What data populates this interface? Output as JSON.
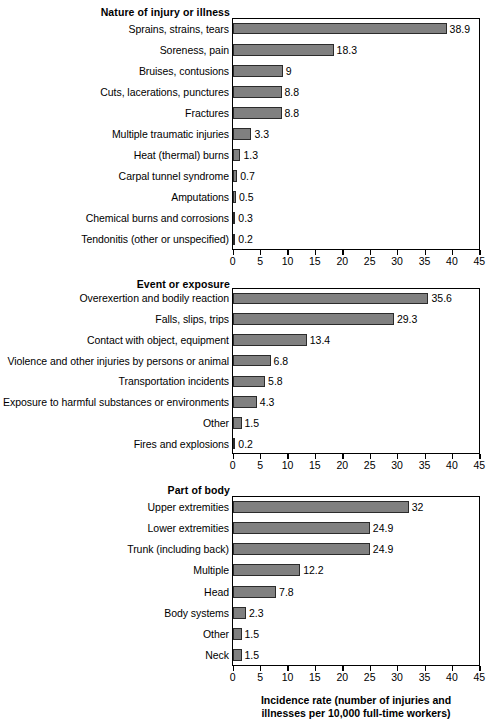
{
  "chart_data": [
    {
      "type": "bar",
      "orientation": "horizontal",
      "title": "Nature of injury or illness",
      "xlabel": "",
      "ylabel": "",
      "xlim": [
        0,
        45
      ],
      "ticks": [
        0,
        5,
        10,
        15,
        20,
        25,
        30,
        35,
        40,
        45
      ],
      "grid": false,
      "legend": "none",
      "categories": [
        "Sprains, strains, tears",
        "Soreness, pain",
        "Bruises, contusions",
        "Cuts, lacerations, punctures",
        "Fractures",
        "Multiple traumatic injuries",
        "Heat (thermal) burns",
        "Carpal tunnel syndrome",
        "Amputations",
        "Chemical burns and corrosions",
        "Tendonitis (other or unspecified)"
      ],
      "values": [
        38.9,
        18.3,
        9,
        8.8,
        8.8,
        3.3,
        1.3,
        0.7,
        0.5,
        0.3,
        0.2
      ],
      "labels": [
        "38.9",
        "18.3",
        "9",
        "8.8",
        "8.8",
        "3.3",
        "1.3",
        "0.7",
        "0.5",
        "0.3",
        "0.2"
      ]
    },
    {
      "type": "bar",
      "orientation": "horizontal",
      "title": "Event or exposure",
      "xlabel": "",
      "ylabel": "",
      "xlim": [
        0,
        45
      ],
      "ticks": [
        0,
        5,
        10,
        15,
        20,
        25,
        30,
        35,
        40,
        45
      ],
      "grid": false,
      "legend": "none",
      "categories": [
        "Overexertion and bodily reaction",
        "Falls, slips, trips",
        "Contact with object, equipment",
        "Violence and other injuries by persons or animal",
        "Transportation incidents",
        "Exposure to harmful substances or environments",
        "Other",
        "Fires and explosions"
      ],
      "values": [
        35.6,
        29.3,
        13.4,
        6.8,
        5.8,
        4.3,
        1.5,
        0.2
      ],
      "labels": [
        "35.6",
        "29.3",
        "13.4",
        "6.8",
        "5.8",
        "4.3",
        "1.5",
        "0.2"
      ]
    },
    {
      "type": "bar",
      "orientation": "horizontal",
      "title": "Part of body",
      "xlabel": "Incidence rate (number of injuries and illnesses per 10,000 full-time workers)",
      "ylabel": "",
      "xlim": [
        0,
        45
      ],
      "ticks": [
        0,
        5,
        10,
        15,
        20,
        25,
        30,
        35,
        40,
        45
      ],
      "grid": false,
      "legend": "none",
      "categories": [
        "Upper extremities",
        "Lower extremities",
        "Trunk (including back)",
        "Multiple",
        "Head",
        "Body systems",
        "Other",
        "Neck"
      ],
      "values": [
        32,
        24.9,
        24.9,
        12.2,
        7.8,
        2.3,
        1.5,
        1.5
      ],
      "labels": [
        "32",
        "24.9",
        "24.9",
        "12.2",
        "7.8",
        "2.3",
        "1.5",
        "1.5"
      ]
    }
  ],
  "axis_caption": {
    "line1": "Incidence rate (number of injuries and",
    "line2": "illnesses per 10,000 full-time workers)"
  },
  "colors": {
    "bar_fill": "#808080",
    "bar_stroke": "#2b2b2b",
    "frame": "#000000",
    "background": "#ffffff",
    "text": "#000000"
  }
}
